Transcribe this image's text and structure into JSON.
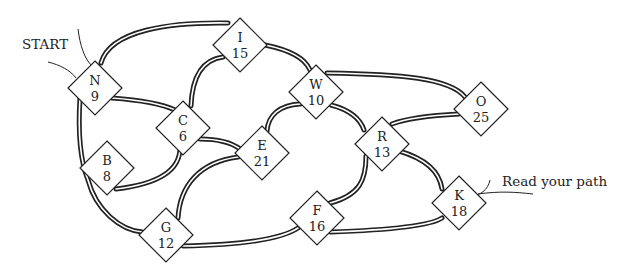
{
  "labels": {
    "start": "START",
    "end": "Read your path"
  },
  "nodes": [
    {
      "id": "N",
      "letter": "N",
      "value": "9",
      "x": 95,
      "y": 88
    },
    {
      "id": "I",
      "letter": "I",
      "value": "15",
      "x": 240,
      "y": 45
    },
    {
      "id": "C",
      "letter": "C",
      "value": "6",
      "x": 183,
      "y": 128
    },
    {
      "id": "W",
      "letter": "W",
      "value": "10",
      "x": 316,
      "y": 92
    },
    {
      "id": "E",
      "letter": "E",
      "value": "21",
      "x": 262,
      "y": 153
    },
    {
      "id": "O",
      "letter": "O",
      "value": "25",
      "x": 481,
      "y": 109
    },
    {
      "id": "R",
      "letter": "R",
      "value": "13",
      "x": 382,
      "y": 144
    },
    {
      "id": "B",
      "letter": "B",
      "value": "8",
      "x": 107,
      "y": 168
    },
    {
      "id": "G",
      "letter": "G",
      "value": "12",
      "x": 166,
      "y": 235
    },
    {
      "id": "F",
      "letter": "F",
      "value": "16",
      "x": 317,
      "y": 218
    },
    {
      "id": "K",
      "letter": "K",
      "value": "18",
      "x": 459,
      "y": 203
    }
  ],
  "edges": [
    [
      "N",
      "I"
    ],
    [
      "N",
      "C"
    ],
    [
      "N",
      "B"
    ],
    [
      "B",
      "G"
    ],
    [
      "B",
      "C"
    ],
    [
      "I",
      "C"
    ],
    [
      "I",
      "W"
    ],
    [
      "W",
      "O"
    ],
    [
      "W",
      "E"
    ],
    [
      "W",
      "R"
    ],
    [
      "C",
      "E"
    ],
    [
      "E",
      "G"
    ],
    [
      "G",
      "F"
    ],
    [
      "F",
      "R"
    ],
    [
      "F",
      "K"
    ],
    [
      "R",
      "O"
    ],
    [
      "R",
      "K"
    ]
  ]
}
